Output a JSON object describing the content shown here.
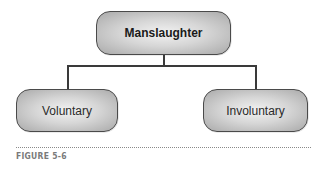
{
  "diagram": {
    "type": "hierarchy",
    "root": {
      "label": "Manslaughter"
    },
    "children": [
      {
        "label": "Voluntary"
      },
      {
        "label": "Involuntary"
      }
    ]
  },
  "caption": {
    "label": "FIGURE 5-6"
  },
  "colors": {
    "node_border": "#4a4a4a",
    "node_fill_center": "#f2f2f2",
    "node_fill_edge": "#a9a9a9",
    "connector": "#3a3a3a",
    "caption_text": "#7a7a7a"
  }
}
